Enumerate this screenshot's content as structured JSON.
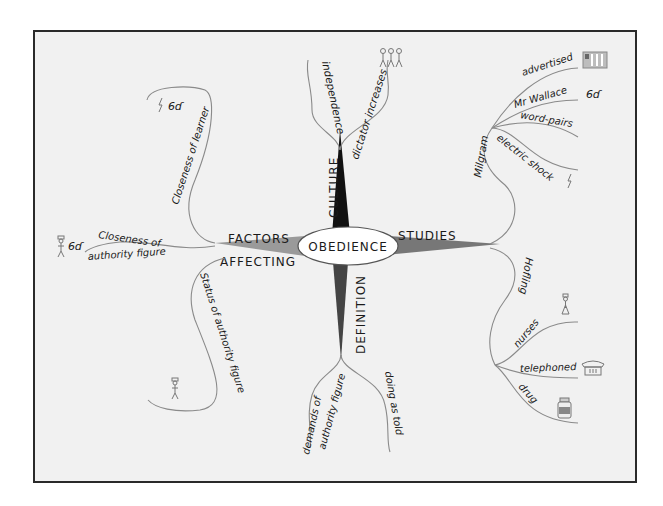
{
  "diagram": {
    "type": "mind-map",
    "central_topic": "OBEDIENCE",
    "main_branches": {
      "culture": {
        "label": "CULTURE",
        "sub": [
          {
            "label": "independence"
          },
          {
            "label": "dictator increases",
            "icon": "three-people-icon"
          }
        ]
      },
      "definition": {
        "label": "DEFINITION",
        "sub": [
          {
            "label": "demands of authority figure",
            "line1": "demands of",
            "line2": "authority figure"
          },
          {
            "label": "doing as told"
          }
        ]
      },
      "factors": {
        "label": "FACTORS AFFECTING",
        "line1": "FACTORS",
        "line2": "AFFECTING",
        "sub": [
          {
            "label": "Closeness of learner",
            "icons": [
              "lightning-icon",
              "glasses-icon"
            ]
          },
          {
            "label": "Closeness of authority figure",
            "line1": "Closeness of",
            "line2": "authority figure",
            "icons": [
              "authority-figure-icon",
              "glasses-icon"
            ]
          },
          {
            "label": "Status of authority figure",
            "icon": "authority-figure-icon"
          }
        ]
      },
      "studies": {
        "label": "STUDIES",
        "sub": [
          {
            "label": "Milgram",
            "children": [
              {
                "label": "advertised",
                "icon": "newspaper-icon"
              },
              {
                "label": "Mr Wallace",
                "icon": "glasses-icon"
              },
              {
                "label": "word-pairs"
              },
              {
                "label": "electric shock",
                "icon": "lightning-icon"
              }
            ]
          },
          {
            "label": "Hofling",
            "children": [
              {
                "label": "nurses",
                "icon": "nurse-icon"
              },
              {
                "label": "telephoned",
                "icon": "telephone-icon"
              },
              {
                "label": "drug",
                "icon": "medicine-bottle-icon"
              }
            ]
          }
        ]
      }
    },
    "colors": {
      "background": "#f1f1f1",
      "frame": "#2a2a2a",
      "branch_line": "#8a8a8a",
      "culture_wedge": "#111111",
      "definition_wedge": "#444444",
      "factors_wedge": "#9a9a9a",
      "studies_wedge": "#777777"
    }
  }
}
